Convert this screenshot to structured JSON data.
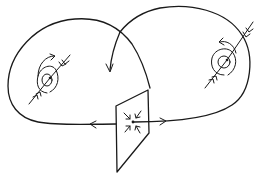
{
  "diagram": {
    "kind": "dynamical-system-phase-portrait",
    "style": "hand-drawn line sketch",
    "ink_color": "#1a1a1a",
    "background": "#ffffff",
    "elements": {
      "left_fixed_point": {
        "type": "spiral-saddle-focus",
        "center": [
          47,
          78
        ],
        "spin": "counterclockwise-outward"
      },
      "right_fixed_point": {
        "type": "spiral-saddle-focus",
        "center": [
          227,
          61
        ],
        "spin": "counterclockwise-outward"
      },
      "cross_section": {
        "type": "poincare-section-plane",
        "center": [
          132,
          125
        ]
      },
      "section_point": {
        "type": "saddle-point",
        "position": [
          132,
          122
        ]
      },
      "left_loop": {
        "type": "homoclinic-orbit",
        "direction": "leftward-at-bottom"
      },
      "right_loop": {
        "type": "homoclinic-orbit",
        "direction": "rightward-at-bottom"
      },
      "descending_arrow": {
        "type": "flow-arrow",
        "direction": "down"
      }
    },
    "labels": []
  }
}
